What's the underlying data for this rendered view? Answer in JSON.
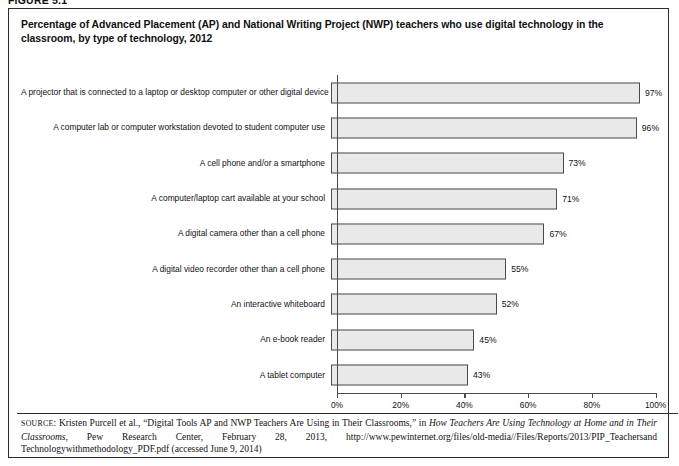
{
  "figure": {
    "label": "FIGURE 5.1"
  },
  "title": "Percentage of Advanced Placement (AP) and National Writing Project (NWP) teachers who use digital technology in the classroom, by type of technology, 2012",
  "chart_data": {
    "type": "bar",
    "orientation": "horizontal",
    "title": "Percentage of Advanced Placement (AP) and National Writing Project (NWP) teachers who use digital technology in the classroom, by type of technology, 2012",
    "xlabel": "",
    "ylabel": "",
    "xlim": [
      0,
      100
    ],
    "xticks": [
      0,
      20,
      40,
      60,
      80,
      100
    ],
    "xtick_labels": [
      "0%",
      "20%",
      "40%",
      "60%",
      "80%",
      "100%"
    ],
    "grid": false,
    "legend": "none",
    "bar_color": "#e9e9e9",
    "bar_border_color": "#4a4a4a",
    "categories": [
      "A projector that is connected to a laptop or desktop computer or other digital device",
      "A computer lab or computer workstation devoted to student computer use",
      "A cell phone and/or a smartphone",
      "A computer/laptop cart available at your school",
      "A digital camera other than a cell phone",
      "A digital video recorder other than a cell phone",
      "An interactive whiteboard",
      "An e-book reader",
      "A tablet computer"
    ],
    "values": [
      97,
      96,
      73,
      71,
      67,
      55,
      52,
      45,
      43
    ],
    "value_labels": [
      "97%",
      "96%",
      "73%",
      "71%",
      "67%",
      "55%",
      "52%",
      "45%",
      "43%"
    ]
  },
  "source": {
    "prefix": "SOURCE",
    "text_1": ": Kristen Purcell et al., “Digital Tools AP and NWP Teachers Are Using in Their Classrooms,” in ",
    "italic_1": "How Teachers Are Using Technology at Home and in Their Classrooms",
    "text_2": ", Pew Research Center, February 28, 2013, http://www.pewinternet.org/files/old-media//Files/Reports/2013/PIP_Teachersand Technologywithmethodology_PDF.pdf (accessed June 9, 2014)"
  }
}
